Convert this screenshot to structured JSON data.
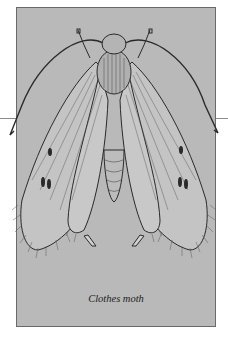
{
  "figure": {
    "caption": "Clothes moth",
    "colors": {
      "panel_background": "#b9b9b9",
      "panel_border": "#6a6a6a",
      "ink": "#2a2a2a",
      "page_background": "#ffffff"
    }
  }
}
